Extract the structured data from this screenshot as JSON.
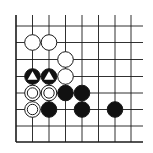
{
  "diagram": {
    "type": "go-board-corner",
    "grid": {
      "columns": 8,
      "rows": 8,
      "x_positions": [
        16,
        32.5,
        49,
        65.5,
        82,
        98.5,
        115,
        131
      ],
      "y_positions": [
        26,
        42.5,
        59.5,
        76.5,
        93,
        109.5,
        126,
        142
      ],
      "line_color": "#1a1a1a",
      "edges": [
        "left",
        "bottom"
      ]
    },
    "stones": [
      {
        "col": 1,
        "row": 1,
        "color": "white",
        "marker": "none"
      },
      {
        "col": 2,
        "row": 1,
        "color": "white",
        "marker": "none"
      },
      {
        "col": 3,
        "row": 2,
        "color": "white",
        "marker": "none"
      },
      {
        "col": 1,
        "row": 3,
        "color": "black",
        "marker": "triangle"
      },
      {
        "col": 2,
        "row": 3,
        "color": "black",
        "marker": "triangle"
      },
      {
        "col": 3,
        "row": 3,
        "color": "white",
        "marker": "none"
      },
      {
        "col": 1,
        "row": 4,
        "color": "white",
        "marker": "circle"
      },
      {
        "col": 2,
        "row": 4,
        "color": "white",
        "marker": "circle"
      },
      {
        "col": 3,
        "row": 4,
        "color": "black",
        "marker": "none"
      },
      {
        "col": 4,
        "row": 4,
        "color": "black",
        "marker": "none"
      },
      {
        "col": 1,
        "row": 5,
        "color": "white",
        "marker": "circle"
      },
      {
        "col": 2,
        "row": 5,
        "color": "black",
        "marker": "none"
      },
      {
        "col": 4,
        "row": 5,
        "color": "black",
        "marker": "none"
      },
      {
        "col": 6,
        "row": 5,
        "color": "black",
        "marker": "none"
      }
    ],
    "colors": {
      "black_stone": "#111111",
      "white_stone": "#ffffff",
      "stone_outline": "#1a1a1a",
      "background": "#ffffff"
    }
  }
}
